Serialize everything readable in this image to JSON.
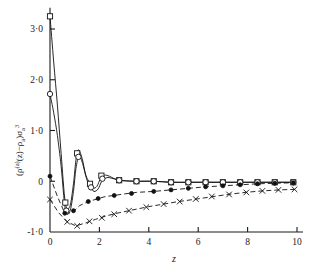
{
  "figure": {
    "name": "density-profile-plot",
    "background": "#ffffff",
    "ink_color": "#111111"
  },
  "chart_data": {
    "type": "line",
    "title": "",
    "subtitle": "",
    "xlabel": "z",
    "ylabel": "(ρ⁽ᵃ⁾(z) − ρₐ)σₐ³",
    "ylabel_parts": {
      "open_paren": "(",
      "rho": "ρ",
      "rho_sup": "(a)",
      "arg": "(z)",
      "minus": "−",
      "rho2": "ρ",
      "rho2_sub": "a",
      "close_paren": ")",
      "sigma": "σ",
      "sigma_sub": "a",
      "sigma_sup": "3"
    },
    "xlim": [
      0,
      10
    ],
    "ylim": [
      -1.0,
      3.4
    ],
    "grid": false,
    "legend": "none",
    "x_ticks": [
      0,
      2,
      4,
      6,
      8,
      10
    ],
    "x_tick_labels": [
      "0",
      "2",
      "4",
      "6",
      "8",
      "10"
    ],
    "y_ticks": [
      -1.0,
      0,
      1.0,
      2.0,
      3.0
    ],
    "y_tick_labels": [
      "-1·0",
      "0",
      "1·0",
      "2·0",
      "3·0"
    ],
    "series": [
      {
        "name": "series-square",
        "marker": "open-square",
        "line": "solid",
        "x": [
          0.0,
          0.15,
          0.3,
          0.45,
          0.62,
          0.8,
          0.95,
          1.05,
          1.15,
          1.3,
          1.45,
          1.6,
          1.75,
          1.9,
          2.05,
          2.2,
          2.4,
          2.6,
          2.8,
          3.0,
          3.5,
          4.2,
          4.9,
          5.6,
          6.3,
          7.0,
          7.7,
          8.4,
          9.1,
          9.85
        ],
        "y": [
          3.25,
          2.35,
          1.5,
          0.55,
          -0.42,
          -0.5,
          -0.05,
          0.42,
          0.62,
          0.45,
          0.12,
          -0.02,
          -0.13,
          -0.1,
          0.06,
          0.12,
          0.1,
          0.05,
          0.02,
          0.01,
          0.0,
          0.0,
          -0.02,
          -0.02,
          -0.02,
          -0.02,
          -0.02,
          -0.02,
          -0.02,
          -0.02
        ],
        "marker_x": [
          0.0,
          0.62,
          1.1,
          1.62,
          2.08,
          2.8,
          3.5,
          4.2,
          4.9,
          5.6,
          6.3,
          7.0,
          7.7,
          8.4,
          9.1,
          9.85
        ],
        "marker_y": [
          3.25,
          -0.42,
          0.55,
          -0.05,
          0.11,
          0.02,
          0.0,
          0.0,
          -0.02,
          -0.02,
          -0.02,
          -0.02,
          -0.02,
          -0.02,
          -0.02,
          -0.02
        ]
      },
      {
        "name": "series-circle",
        "marker": "open-circle",
        "line": "solid",
        "x": [
          0.0,
          0.15,
          0.3,
          0.45,
          0.62,
          0.8,
          0.95,
          1.05,
          1.18,
          1.32,
          1.48,
          1.62,
          1.78,
          1.95,
          2.1,
          2.3,
          2.5,
          2.75,
          3.0,
          3.5,
          4.2,
          4.9,
          5.6,
          6.3,
          7.0,
          7.7,
          8.4,
          9.1,
          9.85
        ],
        "y": [
          1.72,
          1.35,
          0.9,
          0.3,
          -0.55,
          -0.6,
          -0.2,
          0.25,
          0.5,
          0.35,
          0.05,
          -0.1,
          -0.2,
          -0.15,
          0.0,
          0.07,
          0.06,
          0.03,
          0.01,
          0.0,
          0.0,
          -0.02,
          -0.02,
          -0.02,
          -0.02,
          -0.02,
          -0.02,
          -0.02,
          -0.02
        ],
        "marker_x": [
          0.0,
          0.66,
          1.15,
          1.66,
          2.12,
          2.8,
          3.5,
          4.2,
          4.9,
          5.6,
          6.3,
          7.0,
          7.7,
          8.4,
          9.1,
          9.85
        ],
        "marker_y": [
          1.72,
          -0.58,
          0.48,
          -0.12,
          0.05,
          0.02,
          0.0,
          0.0,
          -0.02,
          -0.02,
          -0.02,
          -0.02,
          -0.02,
          -0.02,
          -0.02,
          -0.02
        ]
      },
      {
        "name": "series-dot",
        "marker": "filled-circle",
        "line": "dashed",
        "x": [
          0.0,
          0.3,
          0.6,
          0.9,
          1.2,
          1.55,
          1.9,
          2.25,
          2.6,
          3.0,
          3.5,
          4.2,
          4.9,
          5.6,
          6.3,
          7.0,
          7.7,
          8.4,
          9.1,
          9.85
        ],
        "y": [
          0.1,
          -0.3,
          -0.63,
          -0.62,
          -0.48,
          -0.4,
          -0.35,
          -0.3,
          -0.28,
          -0.25,
          -0.22,
          -0.2,
          -0.17,
          -0.14,
          -0.11,
          -0.09,
          -0.07,
          -0.05,
          -0.04,
          -0.03
        ],
        "marker_x": [
          0.0,
          0.6,
          0.95,
          1.55,
          1.95,
          2.6,
          3.3,
          4.2,
          4.9,
          5.6,
          6.3,
          7.0,
          7.7,
          8.4,
          9.1,
          9.85
        ],
        "marker_y": [
          0.1,
          -0.63,
          -0.58,
          -0.4,
          -0.34,
          -0.28,
          -0.24,
          -0.2,
          -0.17,
          -0.14,
          -0.11,
          -0.09,
          -0.07,
          -0.05,
          -0.04,
          -0.03
        ]
      },
      {
        "name": "series-cross",
        "marker": "cross",
        "line": "dashed",
        "x": [
          0.0,
          0.35,
          0.7,
          1.05,
          1.45,
          1.85,
          2.3,
          2.8,
          3.4,
          4.0,
          4.6,
          5.2,
          5.8,
          6.5,
          7.2,
          7.9,
          8.6,
          9.3,
          9.9
        ],
        "y": [
          -0.36,
          -0.62,
          -0.8,
          -0.88,
          -0.82,
          -0.75,
          -0.68,
          -0.62,
          -0.56,
          -0.5,
          -0.45,
          -0.4,
          -0.36,
          -0.31,
          -0.26,
          -0.22,
          -0.19,
          -0.17,
          -0.16
        ],
        "marker_x": [
          0.0,
          0.7,
          1.1,
          1.6,
          2.1,
          2.6,
          3.2,
          3.9,
          4.6,
          5.25,
          5.9,
          6.55,
          7.25,
          7.95,
          8.6,
          9.25,
          9.9
        ],
        "marker_y": [
          -0.36,
          -0.8,
          -0.88,
          -0.79,
          -0.72,
          -0.65,
          -0.58,
          -0.51,
          -0.45,
          -0.4,
          -0.35,
          -0.3,
          -0.26,
          -0.22,
          -0.19,
          -0.17,
          -0.16
        ]
      }
    ]
  }
}
